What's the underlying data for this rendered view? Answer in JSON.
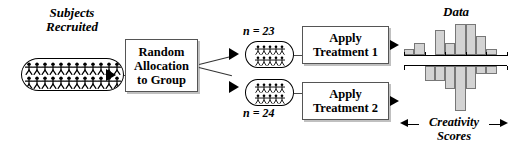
{
  "diagram": {
    "subjects": {
      "label_line1": "Subjects",
      "label_line2": "Recruited",
      "pool_icon": "group-of-people-icon",
      "figures_row1": 12,
      "figures_row2": 12
    },
    "allocation": {
      "label_line1": "Random",
      "label_line2": "Allocation",
      "label_line3": "to Group"
    },
    "groups": [
      {
        "n_label": "n = 23",
        "pool_icon": "group-of-people-icon",
        "figures_row1": 5,
        "figures_row2": 5,
        "treatment_line1": "Apply",
        "treatment_line2": "Treatment 1"
      },
      {
        "n_label": "n = 24",
        "pool_icon": "group-of-people-icon",
        "figures_row1": 5,
        "figures_row2": 5,
        "treatment_line1": "Apply",
        "treatment_line2": "Treatment 2"
      }
    ],
    "data": {
      "label": "Data",
      "axis_label_line1": "Creativity",
      "axis_label_line2": "Scores"
    },
    "colors": {
      "bar_fill": "#d3d3d3",
      "bar_stroke": "#777777",
      "line": "#4a4a4a",
      "text": "#000000",
      "box_stroke": "#555555"
    }
  },
  "chart_data": [
    {
      "type": "bar",
      "id": "histogram-treatment-1",
      "title": "Data",
      "xlabel": "Creativity Scores",
      "ylabel": "",
      "orientation": "up",
      "grid": false,
      "legend": null,
      "categories": [
        "1",
        "2",
        "3",
        "4",
        "5",
        "6",
        "7",
        "8",
        "9",
        "10"
      ],
      "values": [
        2,
        4,
        0,
        8,
        4,
        10,
        10,
        6,
        2,
        0
      ],
      "ylim": [
        0,
        11
      ],
      "tick_count": 6
    },
    {
      "type": "bar",
      "id": "histogram-treatment-2",
      "title": "Data",
      "xlabel": "Creativity Scores",
      "ylabel": "",
      "orientation": "down",
      "grid": false,
      "legend": null,
      "categories": [
        "1",
        "2",
        "3",
        "4",
        "5",
        "6",
        "7",
        "8",
        "9",
        "10"
      ],
      "values": [
        0,
        0,
        4,
        4,
        6,
        12,
        6,
        2,
        2,
        0
      ],
      "ylim": [
        0,
        13
      ],
      "tick_count": 6
    }
  ]
}
